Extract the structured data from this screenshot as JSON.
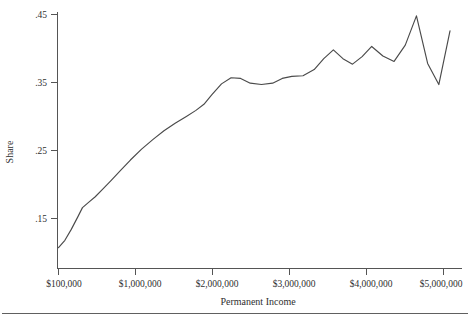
{
  "figure": {
    "title": "",
    "background_color": "#ffffff",
    "line_color": "#4a4a4a",
    "axis_color": "#555555"
  },
  "axes": {
    "x_title": "Permanent Income",
    "y_title": "Share",
    "x_tick_labels": [
      "$100,000",
      "$1,000,000",
      "$2,000,000",
      "$3,000,000",
      "$4,000,000",
      "$5,000,000"
    ],
    "x_tick_values": [
      100000,
      1000000,
      2000000,
      3000000,
      4000000,
      5000000
    ],
    "y_tick_labels": [
      ".45",
      ".35",
      ".25",
      ".15"
    ],
    "y_tick_values": [
      0.45,
      0.35,
      0.25,
      0.15
    ]
  },
  "chart_data": {
    "type": "line",
    "title": "",
    "xlabel": "Permanent Income",
    "ylabel": "Share",
    "xlim": [
      100000,
      5100000
    ],
    "ylim": [
      0.1,
      0.455
    ],
    "grid": false,
    "legend": null,
    "series": [
      {
        "name": "Share of permanent income",
        "x": [
          100000,
          180000,
          260000,
          340000,
          400000,
          480000,
          560000,
          660000,
          760000,
          880000,
          1000000,
          1140000,
          1280000,
          1420000,
          1560000,
          1700000,
          1820000,
          1920000,
          2020000,
          2140000,
          2260000,
          2380000,
          2500000,
          2640000,
          2780000,
          2900000,
          3020000,
          3160000,
          3300000,
          3420000,
          3540000,
          3660000,
          3780000,
          3900000,
          4020000,
          4160000,
          4300000,
          4440000,
          4580000,
          4720000,
          4860000,
          5000000
        ],
        "y": [
          0.107,
          0.118,
          0.134,
          0.152,
          0.166,
          0.174,
          0.182,
          0.194,
          0.206,
          0.221,
          0.236,
          0.252,
          0.266,
          0.279,
          0.29,
          0.3,
          0.309,
          0.318,
          0.332,
          0.348,
          0.357,
          0.356,
          0.349,
          0.347,
          0.349,
          0.356,
          0.359,
          0.36,
          0.369,
          0.385,
          0.398,
          0.385,
          0.377,
          0.388,
          0.403,
          0.389,
          0.381,
          0.405,
          0.448,
          0.378,
          0.347,
          0.426
        ]
      }
    ]
  },
  "footer": {
    "rule_visible": true
  }
}
